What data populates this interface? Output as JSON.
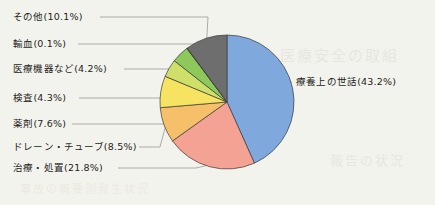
{
  "figure": {
    "background_color": "#f3f3ed",
    "showthrough_1": "医療安全の取組",
    "showthrough_2": "報告の状況",
    "showthrough_3": "事故の概要別発生状況"
  },
  "chart_data": {
    "type": "pie",
    "title": "",
    "subtitle": "",
    "xlabel": "",
    "ylabel": "",
    "legend_position": "callout-labels",
    "grid": false,
    "start_angle_deg": 0,
    "direction": "clockwise",
    "units": "%",
    "total": 100.0,
    "categories": [
      "療養上の世話",
      "治療・処置",
      "ドレーン・チューブ",
      "薬剤",
      "検査",
      "医療機器など",
      "輸血",
      "その他"
    ],
    "values": [
      43.2,
      21.8,
      8.5,
      7.6,
      4.3,
      4.2,
      0.1,
      10.1
    ],
    "colors": [
      "#7fa9dd",
      "#f4a294",
      "#f6c06a",
      "#f7e362",
      "#cfe06a",
      "#8cc85a",
      "#4f9a4a",
      "#6e6e6e"
    ],
    "slices": [
      {
        "label": "療養上の世話",
        "value": 43.2,
        "text": "療養上の世話(43.2%)",
        "color": "#7fa9dd"
      },
      {
        "label": "治療・処置",
        "value": 21.8,
        "text": "治療・処置(21.8%)",
        "color": "#f4a294"
      },
      {
        "label": "ドレーン・チューブ",
        "value": 8.5,
        "text": "ドレーン・チューブ(8.5%)",
        "color": "#f6c06a"
      },
      {
        "label": "薬剤",
        "value": 7.6,
        "text": "薬剤(7.6%)",
        "color": "#f7e362"
      },
      {
        "label": "検査",
        "value": 4.3,
        "text": "検査(4.3%)",
        "color": "#cfe06a"
      },
      {
        "label": "医療機器など",
        "value": 4.2,
        "text": "医療機器など(4.2%)",
        "color": "#8cc85a"
      },
      {
        "label": "輸血",
        "value": 0.1,
        "text": "輸血(0.1%)",
        "color": "#4f9a4a"
      },
      {
        "label": "その他",
        "value": 10.1,
        "text": "その他(10.1%)",
        "color": "#6e6e6e"
      }
    ]
  }
}
